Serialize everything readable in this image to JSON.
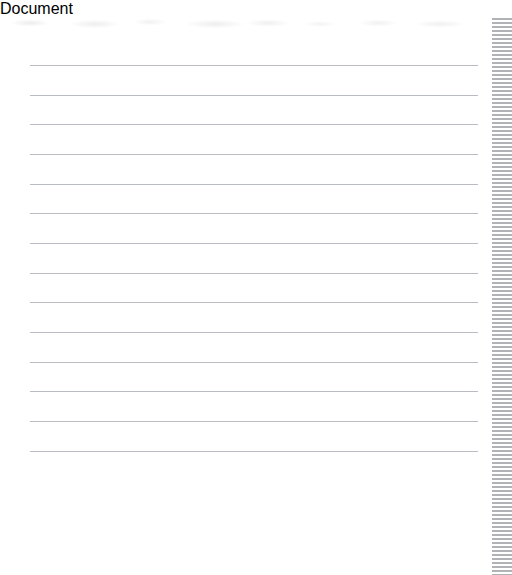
{
  "page": {
    "kind": "ruled-notebook-page",
    "width": 512,
    "height": 557,
    "background_color": "#ffffff"
  },
  "rules": {
    "count": 14,
    "line_color": "#b9bcc0",
    "line_thickness_px": 1,
    "x_start_px": 30,
    "x_end_px": 478,
    "first_line_y_px": 47,
    "line_pitch_px": 29.7,
    "y_positions_px": [
      47,
      77,
      106,
      136,
      166,
      195,
      225,
      255,
      284,
      314,
      344,
      373,
      403,
      433
    ]
  },
  "ghost_band": {
    "description": "faint illegible bleed-through smudges along the top edge",
    "y_px": 0,
    "height_px": 13,
    "color": "#8c8e94"
  },
  "edge_strip": {
    "description": "dense horizontal gray stripe pattern along the right edge",
    "x_px": 492,
    "width_px": 20,
    "stripe_color": "#b0b2b6",
    "gap_color": "#ffffff",
    "stripe_pitch_px": 4
  },
  "blank_region": {
    "description": "unruled empty white space below the last line",
    "y_px": 440,
    "height_px": 117
  }
}
